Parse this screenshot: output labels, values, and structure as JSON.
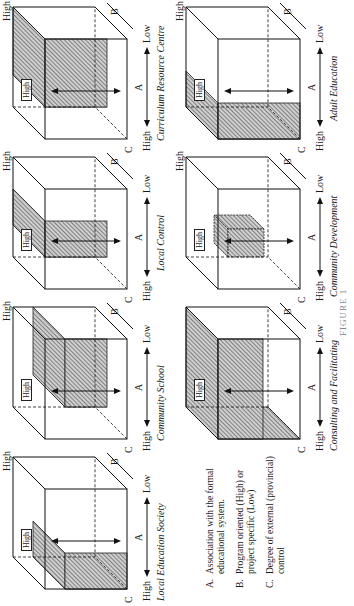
{
  "legend": {
    "items": [
      {
        "key": "A.",
        "text": "Association with the formal educational system."
      },
      {
        "key": "B.",
        "text": "Program oriented (High) or project specific (Low)"
      },
      {
        "key": "C.",
        "text": "Degree of external (provincial) control"
      }
    ]
  },
  "axis_labels": {
    "a": "A",
    "b": "B",
    "c": "C",
    "high": "High",
    "low": "Low"
  },
  "panels": [
    {
      "id": "local-education-society",
      "title": "Local Education Society",
      "row": 0,
      "col": 0
    },
    {
      "id": "community-school",
      "title": "Community School",
      "row": 0,
      "col": 1
    },
    {
      "id": "local-control",
      "title": "Local Control",
      "row": 0,
      "col": 2
    },
    {
      "id": "curriculum-resource-centre",
      "title": "Curriculum Resource Centre",
      "row": 0,
      "col": 3
    },
    {
      "id": "consulting-and-facilitating",
      "title": "Consulting and Facilitating",
      "row": 1,
      "col": 1
    },
    {
      "id": "community-development",
      "title": "Community Development",
      "row": 1,
      "col": 2
    },
    {
      "id": "adult-education",
      "title": "Adult Education",
      "row": 1,
      "col": 3
    }
  ],
  "caption": "FIGURE 1"
}
